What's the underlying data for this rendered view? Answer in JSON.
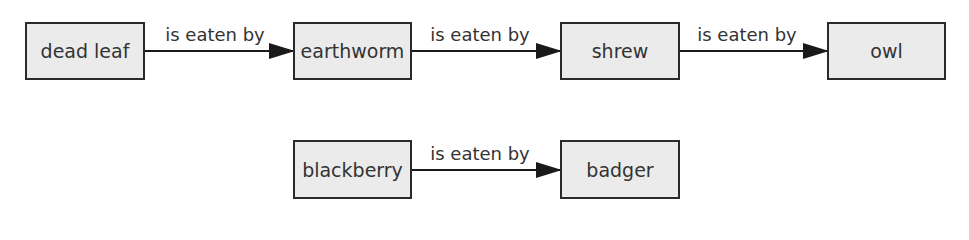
{
  "diagram": {
    "type": "food-chain",
    "nodes": [
      {
        "id": "dead-leaf",
        "label": "dead leaf"
      },
      {
        "id": "earthworm",
        "label": "earthworm"
      },
      {
        "id": "shrew",
        "label": "shrew"
      },
      {
        "id": "owl",
        "label": "owl"
      },
      {
        "id": "blackberry",
        "label": "blackberry"
      },
      {
        "id": "badger",
        "label": "badger"
      }
    ],
    "edges": [
      {
        "from": "dead-leaf",
        "to": "earthworm",
        "label": "is eaten by"
      },
      {
        "from": "earthworm",
        "to": "shrew",
        "label": "is eaten by"
      },
      {
        "from": "shrew",
        "to": "owl",
        "label": "is eaten by"
      },
      {
        "from": "blackberry",
        "to": "badger",
        "label": "is eaten by"
      }
    ],
    "colors": {
      "box_fill": "#ebebeb",
      "box_border": "#2a2a2a",
      "arrow": "#1a1a1a",
      "text": "#333333"
    }
  }
}
